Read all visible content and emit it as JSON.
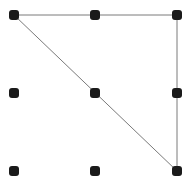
{
  "figure": {
    "width": 191,
    "height": 187,
    "background_color": "#ffffff",
    "dot_color": "#1a1a1a",
    "dot_size": 10,
    "dot_corner_radius": 3,
    "edge_color": "#7a7a7a",
    "edge_width": 1,
    "grid": {
      "columns_x": [
        14,
        95,
        177
      ],
      "rows_y": [
        15,
        93,
        171
      ]
    },
    "dots": [
      {
        "x": 14,
        "y": 15
      },
      {
        "x": 95,
        "y": 15
      },
      {
        "x": 177,
        "y": 15
      },
      {
        "x": 14,
        "y": 93
      },
      {
        "x": 95,
        "y": 93
      },
      {
        "x": 177,
        "y": 93
      },
      {
        "x": 14,
        "y": 171
      },
      {
        "x": 95,
        "y": 171
      },
      {
        "x": 177,
        "y": 171
      }
    ],
    "triangle": {
      "vertices": [
        {
          "x": 14,
          "y": 15
        },
        {
          "x": 177,
          "y": 15
        },
        {
          "x": 177,
          "y": 171
        }
      ],
      "closed": true
    }
  }
}
